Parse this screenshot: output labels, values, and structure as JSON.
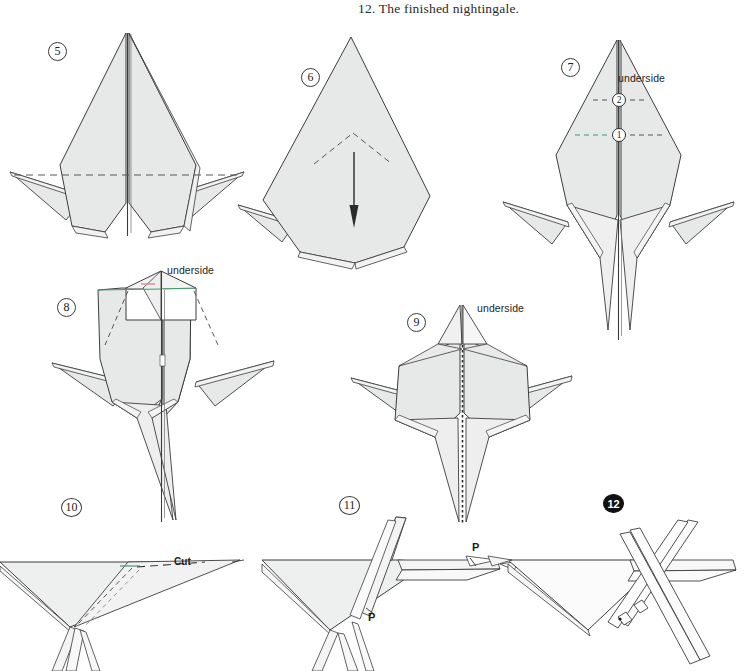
{
  "page": {
    "caption": "12.  The finished nightingale.",
    "background_color": "#ffffff",
    "paper_fill": "#e7e8e8",
    "paper_fill_light": "#f0f0f0",
    "line_color": "#3c3c3c",
    "fold_dash_color": "#555555",
    "accent_green": "#3f9b6d",
    "accent_pink": "#d98a9a"
  },
  "steps": [
    {
      "id": "5",
      "marker": "5",
      "marker_style": "circle-outline",
      "marker_x": 48,
      "marker_y": 42,
      "labels": []
    },
    {
      "id": "6",
      "marker": "6",
      "marker_style": "circle-outline",
      "marker_x": 301,
      "marker_y": 68,
      "labels": []
    },
    {
      "id": "7",
      "marker": "7",
      "marker_style": "circle-outline",
      "marker_x": 561,
      "marker_y": 58,
      "labels": [
        "underside",
        "2",
        "1"
      ]
    },
    {
      "id": "8",
      "marker": "8",
      "marker_style": "circle-outline",
      "marker_x": 57,
      "marker_y": 298,
      "labels": [
        "underside"
      ]
    },
    {
      "id": "9",
      "marker": "9",
      "marker_style": "circle-outline",
      "marker_x": 407,
      "marker_y": 313,
      "labels": [
        "underside"
      ]
    },
    {
      "id": "10",
      "marker": "10",
      "marker_style": "circle-outline",
      "marker_x": 61,
      "marker_y": 498,
      "labels": [
        "Cut"
      ]
    },
    {
      "id": "11",
      "marker": "11",
      "marker_style": "circle-outline",
      "marker_x": 339,
      "marker_y": 496,
      "labels": [
        "P",
        "P"
      ]
    },
    {
      "id": "12",
      "marker": "12",
      "marker_style": "circle-filled",
      "marker_x": 603,
      "marker_y": 494,
      "labels": []
    }
  ],
  "annotations": {
    "underside_7": {
      "text": "underside",
      "x": 618,
      "y": 72
    },
    "underside_8": {
      "text": "underside",
      "x": 167,
      "y": 264
    },
    "underside_9": {
      "text": "underside",
      "x": 477,
      "y": 302
    },
    "fold_num_2": {
      "text": "2",
      "x": 619,
      "y": 93
    },
    "fold_num_1": {
      "text": "1",
      "x": 619,
      "y": 128
    },
    "cut": {
      "text": "Cut",
      "x": 174,
      "y": 556
    },
    "p_upper": {
      "text": "P",
      "x": 472,
      "y": 549
    },
    "p_lower": {
      "text": "P",
      "x": 368,
      "y": 613
    }
  }
}
